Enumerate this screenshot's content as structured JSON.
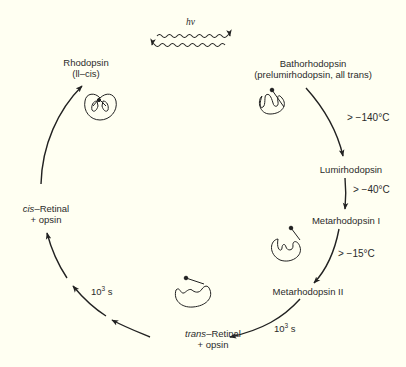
{
  "diagram": {
    "background_color": "#fffff2",
    "line_color": "#222222",
    "light": {
      "label": "hν",
      "forward_arrow": "wavy-right",
      "reverse_arrow": "wavy-left"
    },
    "states": [
      {
        "id": "rhodopsin",
        "name": "Rhodopsin",
        "detail": "(ll–cis)",
        "icon": "retinal-cis-bound-protein-icon"
      },
      {
        "id": "bathorhodopsin",
        "name": "Bathorhodopsin",
        "detail": "(prelumirhodopsin, all trans)",
        "icon": "retinal-trans-bound-protein-icon"
      },
      {
        "id": "lumirhodopsin",
        "name": "Lumirhodopsin"
      },
      {
        "id": "metarhodopsin-1",
        "name": "Metarhodopsin I",
        "icon": "retinal-trans-partial-protein-icon"
      },
      {
        "id": "metarhodopsin-2",
        "name": "Metarhodopsin II"
      },
      {
        "id": "trans-retinal",
        "name_prefix": "trans",
        "name_suffix": "–Retinal",
        "detail": "+ opsin",
        "icon": "retinal-released-protein-icon"
      },
      {
        "id": "cis-retinal",
        "name_prefix": "cis",
        "name_suffix": "–Retinal",
        "detail": "+ opsin"
      }
    ],
    "transitions": [
      {
        "from": "bathorhodopsin",
        "to": "lumirhodopsin",
        "condition": "> −140°C"
      },
      {
        "from": "lumirhodopsin",
        "to": "metarhodopsin-1",
        "condition": "> −40°C"
      },
      {
        "from": "metarhodopsin-1",
        "to": "metarhodopsin-2",
        "condition": "> −15°C"
      },
      {
        "from": "metarhodopsin-2",
        "to": "trans-retinal",
        "time_base": "10",
        "time_exp": "3",
        "time_unit": " s"
      },
      {
        "from": "trans-retinal",
        "to": "cis-retinal",
        "time_base": "10",
        "time_exp": "3",
        "time_unit": " s"
      },
      {
        "from": "cis-retinal",
        "to": "rhodopsin"
      }
    ]
  }
}
